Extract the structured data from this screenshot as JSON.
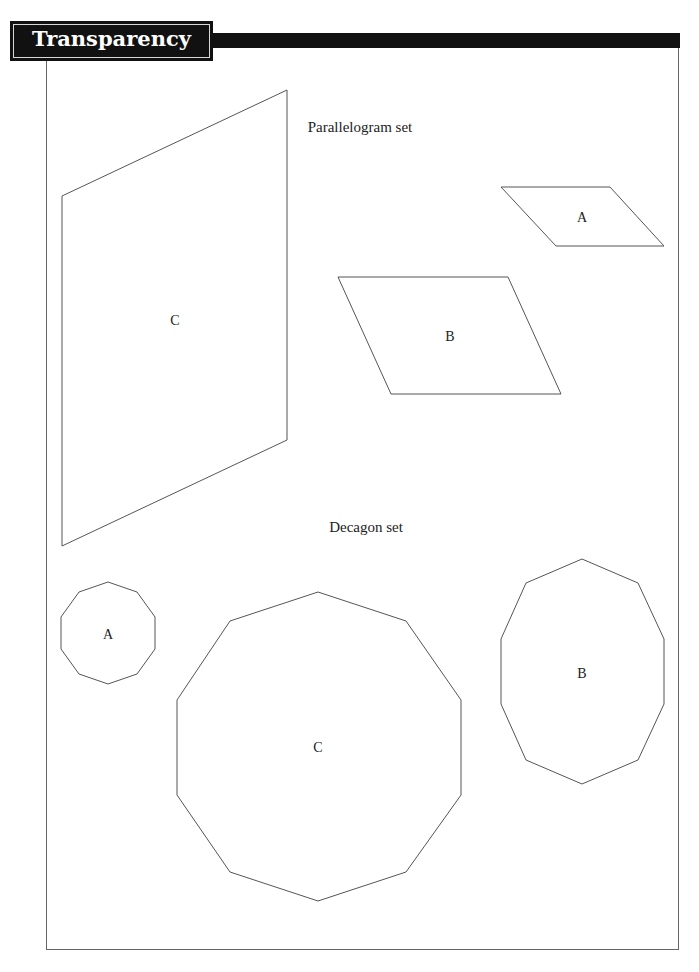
{
  "header": {
    "title": "Transparency 3.1B",
    "subtitle": "Polygon Sets"
  },
  "colors": {
    "header_bg": "#111111",
    "header_text": "#ffffff",
    "line": "#555555",
    "text": "#222222"
  },
  "sets": {
    "parallelogram": {
      "heading": "Parallelogram set",
      "shapes": [
        {
          "label": "A",
          "points": "501,187 610,187 664,246 556,246",
          "label_x": 582,
          "label_y": 222
        },
        {
          "label": "B",
          "points": "338,277 508,277 561,394 391,394",
          "label_x": 450,
          "label_y": 341
        },
        {
          "label": "C",
          "points": "62,196 287,90 287,440 62,546",
          "label_x": 175,
          "label_y": 325
        }
      ]
    },
    "decagon": {
      "heading": "Decagon set",
      "shapes": [
        {
          "label": "A",
          "points": "108,582 137,592 155,617 155,649 137,674 108,684 79,674 61,649 61,617 79,592",
          "label_x": 108,
          "label_y": 639
        },
        {
          "label": "B",
          "points": "582,559 638,583 664,639 664,704 638,760 582,784 526,760 501,704 501,639 526,583",
          "label_x": 582,
          "label_y": 678
        },
        {
          "label": "C",
          "points": "318,592 406,621 461,700 461,795 406,872 318,901 230,872 177,795 177,700 230,621",
          "label_x": 318,
          "label_y": 752
        }
      ]
    }
  }
}
